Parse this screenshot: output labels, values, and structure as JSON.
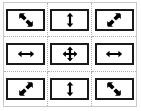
{
  "widget": {
    "name": "resize-cursor-grid",
    "rows": 3,
    "columns": 3,
    "frame_color": "#c9c9c9",
    "gridline_color": "#b0b0b0",
    "box_border_color": "#1a1a1a",
    "glyph_color": "#000000",
    "background_color": "#ffffff"
  },
  "cells": [
    {
      "position": "top-left",
      "row": 0,
      "col": 0,
      "icon": "resize-nwse-icon",
      "label": "↖↘",
      "direction": "nwse"
    },
    {
      "position": "top-center",
      "row": 0,
      "col": 1,
      "icon": "resize-ns-icon",
      "label": "↕",
      "direction": "ns"
    },
    {
      "position": "top-right",
      "row": 0,
      "col": 2,
      "icon": "resize-nesw-icon",
      "label": "↗↙",
      "direction": "nesw"
    },
    {
      "position": "middle-left",
      "row": 1,
      "col": 0,
      "icon": "resize-ew-icon",
      "label": "↔",
      "direction": "ew"
    },
    {
      "position": "middle-center",
      "row": 1,
      "col": 1,
      "icon": "move-all-directions-icon",
      "label": "✥",
      "direction": "all"
    },
    {
      "position": "middle-right",
      "row": 1,
      "col": 2,
      "icon": "resize-ew-icon",
      "label": "↔",
      "direction": "ew"
    },
    {
      "position": "bottom-left",
      "row": 2,
      "col": 0,
      "icon": "resize-nesw-icon",
      "label": "↗↙",
      "direction": "nesw"
    },
    {
      "position": "bottom-center",
      "row": 2,
      "col": 1,
      "icon": "resize-ns-icon",
      "label": "↕",
      "direction": "ns"
    },
    {
      "position": "bottom-right",
      "row": 2,
      "col": 2,
      "icon": "resize-nwse-icon",
      "label": "↖↘",
      "direction": "nwse"
    }
  ]
}
